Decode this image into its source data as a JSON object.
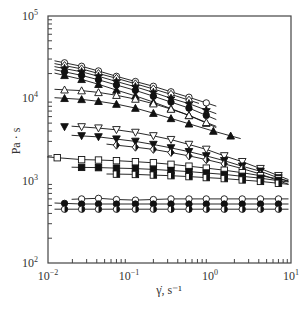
{
  "chart_data": {
    "type": "scatter",
    "title": "",
    "xlabel": "γ̇, s⁻¹",
    "ylabel": "Pa · s",
    "xscale": "log",
    "yscale": "log",
    "xlim": [
      0.01,
      10
    ],
    "ylim": [
      100,
      100000
    ],
    "grid": false,
    "legend": "none",
    "x_tick_labels": [
      {
        "base": "10",
        "exp": "−2"
      },
      {
        "base": "10",
        "exp": "−1"
      },
      {
        "base": "10",
        "exp": "0"
      },
      {
        "base": "10",
        "exp": "1"
      }
    ],
    "y_tick_labels": [
      {
        "base": "10",
        "exp": "2"
      },
      {
        "base": "10",
        "exp": "3"
      },
      {
        "base": "10",
        "exp": "4"
      },
      {
        "base": "10",
        "exp": "5"
      }
    ],
    "series": [
      {
        "name": "open-circle-top",
        "marker": "circle-open",
        "x": [
          0.016,
          0.026,
          0.042,
          0.07,
          0.12,
          0.2,
          0.33,
          0.55,
          0.9
        ],
        "y": [
          27000,
          24500,
          21500,
          18500,
          16000,
          14000,
          12000,
          10300,
          8800
        ]
      },
      {
        "name": "open-diamond-top",
        "marker": "diamond-open",
        "x": [
          0.016,
          0.026,
          0.042,
          0.07,
          0.12,
          0.2,
          0.33,
          0.55
        ],
        "y": [
          25000,
          22800,
          20000,
          17500,
          15000,
          13000,
          11200,
          9500
        ]
      },
      {
        "name": "filled-star",
        "marker": "star-filled",
        "x": [
          0.016,
          0.026,
          0.042,
          0.07,
          0.12,
          0.2,
          0.33,
          0.55,
          0.9
        ],
        "y": [
          23000,
          21000,
          18500,
          16000,
          13800,
          11800,
          10000,
          8600,
          7200
        ]
      },
      {
        "name": "filled-circle-top",
        "marker": "circle-filled",
        "x": [
          0.016,
          0.026,
          0.042,
          0.07,
          0.12,
          0.2,
          0.33,
          0.55,
          0.9
        ],
        "y": [
          21000,
          19000,
          16800,
          14500,
          12500,
          10600,
          9000,
          7600,
          6200
        ]
      },
      {
        "name": "filled-triangle-a",
        "marker": "triangle-filled",
        "x": [
          0.016,
          0.026,
          0.042,
          0.07,
          0.12,
          0.2,
          0.33,
          0.55,
          0.9
        ],
        "y": [
          19000,
          17000,
          14800,
          12600,
          10700,
          9000,
          7500,
          6200,
          5000
        ]
      },
      {
        "name": "open-triangle",
        "marker": "triangle-open",
        "x": [
          0.016,
          0.026,
          0.042,
          0.07,
          0.12,
          0.2,
          0.33,
          0.55,
          0.9
        ],
        "y": [
          12700,
          12400,
          11800,
          10900,
          9800,
          8600,
          7400,
          6200,
          5100
        ]
      },
      {
        "name": "filled-triangle-b",
        "marker": "triangle-filled",
        "x": [
          0.016,
          0.026,
          0.042,
          0.07,
          0.12,
          0.2,
          0.33,
          0.55,
          1.1,
          1.8
        ],
        "y": [
          10000,
          9700,
          9200,
          8500,
          7600,
          6600,
          5700,
          4900,
          4000,
          3500
        ]
      },
      {
        "name": "filled-inv-triangle-a",
        "marker": "inv-triangle-filled",
        "x": [
          0.016
        ],
        "y": [
          4500
        ]
      },
      {
        "name": "open-inv-triangle",
        "marker": "inv-triangle-open",
        "x": [
          0.026,
          0.042,
          0.07,
          0.12,
          0.2,
          0.33,
          0.55,
          0.9,
          1.5,
          2.5,
          4.2,
          7.0
        ],
        "y": [
          4500,
          4350,
          4150,
          3850,
          3500,
          3150,
          2750,
          2400,
          2000,
          1700,
          1400,
          1150
        ]
      },
      {
        "name": "filled-inv-triangle-b",
        "marker": "inv-triangle-filled",
        "x": [
          0.026,
          0.042,
          0.07,
          0.12,
          0.2,
          0.33,
          0.55,
          0.9,
          1.5,
          2.5,
          4.2,
          7.0
        ],
        "y": [
          3500,
          3400,
          3200,
          3000,
          2750,
          2500,
          2250,
          2000,
          1750,
          1500,
          1300,
          1080
        ]
      },
      {
        "name": "half-filled-diamond",
        "marker": "diamond-half",
        "x": [
          0.07,
          0.12,
          0.2,
          0.33,
          0.55,
          0.9,
          1.5,
          2.5,
          4.2,
          7.0
        ],
        "y": [
          2700,
          2550,
          2400,
          2200,
          2000,
          1800,
          1600,
          1400,
          1200,
          1000
        ]
      },
      {
        "name": "open-square",
        "marker": "square-open",
        "x": [
          0.013,
          0.026,
          0.042,
          0.07,
          0.12,
          0.2,
          0.33,
          0.55,
          0.9,
          1.5,
          2.5,
          4.2,
          7.0
        ],
        "y": [
          1900,
          1800,
          1780,
          1750,
          1700,
          1650,
          1580,
          1500,
          1420,
          1340,
          1250,
          1150,
          1050
        ]
      },
      {
        "name": "filled-square",
        "marker": "square-filled",
        "x": [
          0.026,
          0.042,
          0.07,
          0.12,
          0.2,
          0.33,
          0.55,
          0.9,
          1.5,
          2.5,
          4.2,
          7.0
        ],
        "y": [
          1450,
          1440,
          1420,
          1400,
          1370,
          1330,
          1290,
          1240,
          1190,
          1130,
          1070,
          1000
        ]
      },
      {
        "name": "half-filled-square",
        "marker": "square-half",
        "x": [
          0.07,
          0.12,
          0.2,
          0.33,
          0.55,
          0.9,
          1.5,
          2.5,
          4.2,
          7.0
        ],
        "y": [
          1200,
          1190,
          1170,
          1150,
          1120,
          1090,
          1060,
          1020,
          980,
          930
        ]
      },
      {
        "name": "open-circle-bottom",
        "marker": "circle-open",
        "x": [
          0.026,
          0.042,
          0.07,
          0.12,
          0.2,
          0.33,
          0.55,
          0.9,
          1.5,
          2.5,
          4.2,
          7.0
        ],
        "y": [
          600,
          610,
          590,
          580,
          590,
          600,
          600,
          600,
          600,
          600,
          600,
          600
        ]
      },
      {
        "name": "filled-circle-bottom",
        "marker": "circle-filled",
        "x": [
          0.016,
          0.026,
          0.042,
          0.07,
          0.12,
          0.2,
          0.33,
          0.55,
          0.9,
          1.5,
          2.5,
          4.2,
          7.0
        ],
        "y": [
          530,
          520,
          520,
          520,
          520,
          520,
          520,
          520,
          520,
          520,
          520,
          520,
          520
        ]
      },
      {
        "name": "half-filled-circle-bottom",
        "marker": "circle-half",
        "x": [
          0.016,
          0.026,
          0.042,
          0.07,
          0.12,
          0.2,
          0.33,
          0.55,
          0.9,
          1.5,
          2.5,
          4.2,
          7.0
        ],
        "y": [
          450,
          450,
          450,
          450,
          450,
          450,
          450,
          450,
          450,
          450,
          450,
          450,
          450
        ]
      }
    ]
  }
}
